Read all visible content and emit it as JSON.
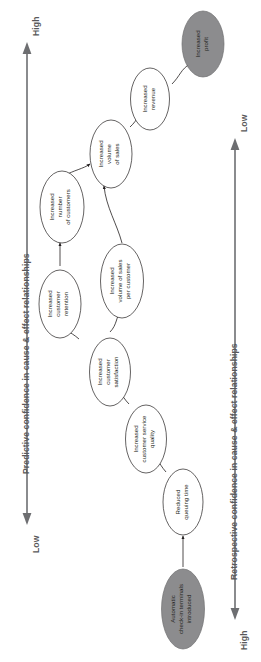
{
  "figure": {
    "type": "causal-chain-diagram",
    "background_color": "#ffffff",
    "node_fill_white": "#ffffff",
    "node_fill_gray": "#8c8c8e",
    "node_stroke": "#231f20",
    "axis_color": "#6d6e71",
    "text_color": "#58585a"
  },
  "left_axis": {
    "title": "Predictive confidence in cause & effect relationships",
    "low_label": "Low",
    "high_label": "High",
    "arrow_low_at": "bottom",
    "arrow_high_at": "top"
  },
  "right_axis": {
    "title": "Retrospective confidence in cause & effect relationships",
    "low_label": "Low",
    "high_label": "High",
    "arrow_low_at": "top",
    "arrow_high_at": "bottom"
  },
  "nodes": [
    {
      "id": "terminals",
      "label_lines": [
        "Automatic",
        "check-in terminals",
        "introduced"
      ],
      "style": "gray"
    },
    {
      "id": "queuing",
      "label_lines": [
        "Reduced",
        "queuing time"
      ],
      "style": "white"
    },
    {
      "id": "service",
      "label_lines": [
        "Increased",
        "customer service",
        "quality"
      ],
      "style": "white"
    },
    {
      "id": "satisfaction",
      "label_lines": [
        "Increased",
        "customer",
        "satisfaction"
      ],
      "style": "white"
    },
    {
      "id": "retention",
      "label_lines": [
        "Increased",
        "customer",
        "retention"
      ],
      "style": "white"
    },
    {
      "id": "sales_per_cust",
      "label_lines": [
        "Increased",
        "volume of sales",
        "per customer"
      ],
      "style": "white"
    },
    {
      "id": "customers",
      "label_lines": [
        "Increased",
        "number",
        "of customers"
      ],
      "style": "white"
    },
    {
      "id": "sales_volume",
      "label_lines": [
        "Increased",
        "volume",
        "of sales"
      ],
      "style": "white"
    },
    {
      "id": "revenue",
      "label_lines": [
        "Increased",
        "revenue"
      ],
      "style": "white"
    },
    {
      "id": "profit",
      "label_lines": [
        "Increased",
        "profit"
      ],
      "style": "gray"
    }
  ],
  "edges": [
    {
      "from": "terminals",
      "to": "queuing"
    },
    {
      "from": "queuing",
      "to": "service"
    },
    {
      "from": "service",
      "to": "satisfaction"
    },
    {
      "from": "satisfaction",
      "to": "retention"
    },
    {
      "from": "satisfaction",
      "to": "sales_per_cust"
    },
    {
      "from": "retention",
      "to": "customers"
    },
    {
      "from": "customers",
      "to": "sales_volume"
    },
    {
      "from": "sales_per_cust",
      "to": "sales_volume"
    },
    {
      "from": "sales_volume",
      "to": "revenue"
    },
    {
      "from": "revenue",
      "to": "profit"
    }
  ]
}
